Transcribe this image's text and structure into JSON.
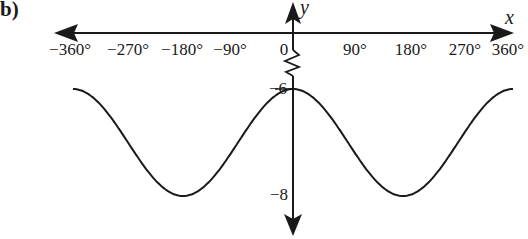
{
  "part_label": "b)",
  "chart_data": {
    "type": "line",
    "title": "",
    "function": "y = cos(x) - 7",
    "xlabel": "x",
    "ylabel": "y",
    "x_ticks": [
      "-360°",
      "-270°",
      "-180°",
      "-90°",
      "90°",
      "180°",
      "270°",
      "360°"
    ],
    "origin_label": "0",
    "y_ticks": [
      "-6",
      "-8"
    ],
    "xlim": [
      -360,
      360
    ],
    "ylim": [
      -8,
      -6
    ],
    "y_axis_break": true,
    "grid": false,
    "legend": "none",
    "series": [
      {
        "name": "curve",
        "x": [
          -360,
          -270,
          -180,
          -90,
          0,
          90,
          180,
          270,
          360
        ],
        "values": [
          -6,
          -7,
          -8,
          -7,
          -6,
          -7,
          -8,
          -7,
          -6
        ]
      }
    ]
  },
  "labels": {
    "x_axis": "x",
    "y_axis": "y",
    "origin": "0",
    "y_max": "−6",
    "y_min": "−8",
    "ticks": {
      "m360": "−360°",
      "m270": "−270°",
      "m180": "−180°",
      "m90": "−90°",
      "p90": "90°",
      "p180": "180°",
      "p270": "270°",
      "p360": "360°"
    }
  },
  "colors": {
    "ink": "#1a1a1a",
    "background": "#ffffff"
  }
}
